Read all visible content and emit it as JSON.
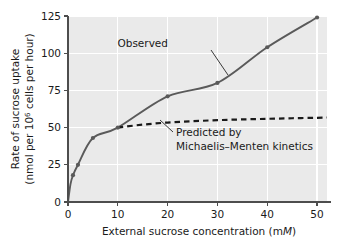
{
  "chart_data": {
    "type": "line",
    "title": "",
    "xlabel": "External sucrose concentration (mM)",
    "xlabel_plain": "External sucrose concentration (m",
    "xlabel_italic": "M",
    "xlabel_tail": ")",
    "ylabel_line1": "Rate of sucrose uptake",
    "ylabel_line2_pre": "(nmol per 10",
    "ylabel_line2_sup": "6",
    "ylabel_line2_post": " cells per hour)",
    "xlim": [
      0,
      52
    ],
    "ylim": [
      0,
      125
    ],
    "xticks": [
      0,
      10,
      20,
      30,
      40,
      50
    ],
    "xtick_labels": [
      "0",
      "10",
      "20",
      "30",
      "40",
      "50"
    ],
    "yticks": [
      0,
      25,
      50,
      75,
      100,
      125
    ],
    "ytick_labels": [
      "0",
      "25",
      "50",
      "75",
      "100",
      "125"
    ],
    "grid": true,
    "grid_color": "#ffffff",
    "plot_bg": "#eaeaea",
    "legend": "none",
    "series": [
      {
        "name": "Observed",
        "style": "solid",
        "color": "#5a5a5a",
        "marker": "circle",
        "x": [
          0,
          0.5,
          1,
          2,
          5,
          10,
          20,
          30,
          40,
          50
        ],
        "y": [
          0,
          12,
          18,
          25,
          43,
          50,
          71,
          80,
          104,
          124
        ],
        "points_x": [
          1,
          2,
          5,
          10,
          20,
          30,
          40,
          50
        ],
        "points_y": [
          18,
          25,
          43,
          50,
          71,
          80,
          104,
          124
        ]
      },
      {
        "name": "Predicted by Michaelis-Menten kinetics",
        "style": "dashed",
        "color": "#1a1a1a",
        "marker": "none",
        "x": [
          10,
          15,
          20,
          25,
          30,
          35,
          40,
          45,
          50,
          52
        ],
        "y": [
          50,
          52,
          53.4,
          54.3,
          55,
          55.5,
          55.9,
          56.3,
          56.6,
          56.8
        ]
      }
    ],
    "annotations": [
      {
        "id": "observed",
        "text": "Observed",
        "x_px": 168,
        "y_px": 47,
        "leader_from_x": 211,
        "leader_from_y": 50,
        "leader_to_x": 228,
        "leader_to_y": 75
      },
      {
        "id": "predicted",
        "line1": "Predicted by",
        "line2": "Michaelis–Menten kinetics",
        "x_px": 176,
        "y_px": 136,
        "leader_from_x": 173,
        "leader_from_y": 132,
        "leader_to_x": 160,
        "leader_to_y": 120
      }
    ]
  }
}
